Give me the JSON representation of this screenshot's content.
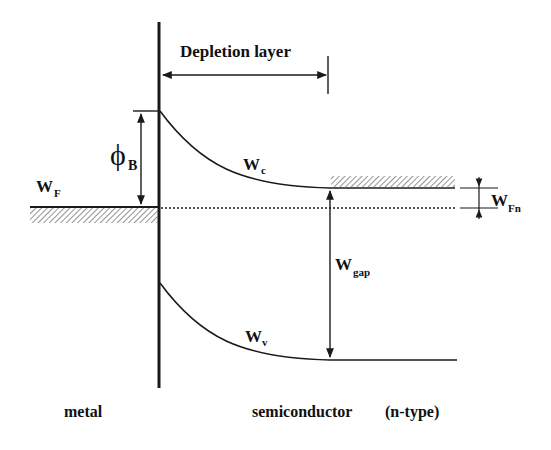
{
  "labels": {
    "depletion": "Depletion layer",
    "phi_main": "ϕ",
    "phi_sub": "B",
    "wf_main": "W",
    "wf_sub": "F",
    "wc_main": "W",
    "wc_sub": "c",
    "wfn_main": "W",
    "wfn_sub": "Fn",
    "wgap_main": "W",
    "wgap_sub": "gap",
    "wv_main": "W",
    "wv_sub": "v",
    "metal": "metal",
    "semiconductor": "semiconductor",
    "ntype": "(n-type)"
  },
  "colors": {
    "line": "#1a1a1a",
    "hatch": "#555555",
    "background": "#ffffff"
  }
}
